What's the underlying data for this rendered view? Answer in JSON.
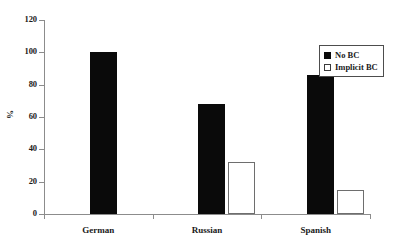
{
  "chart_data": {
    "type": "bar",
    "title": "",
    "xlabel": "",
    "ylabel": "%",
    "ylim": [
      0,
      120
    ],
    "yticks": [
      0,
      20,
      40,
      60,
      80,
      100,
      120
    ],
    "ytick_labels": [
      "0",
      "20",
      "40",
      "60",
      "80",
      "100",
      "120"
    ],
    "grid": false,
    "legend_position": "top-right",
    "categories": [
      "German",
      "Russian",
      "Spanish"
    ],
    "series": [
      {
        "name": "No BC",
        "style": "filled-black",
        "color": "#0a0a0a",
        "values": [
          100,
          68,
          86
        ]
      },
      {
        "name": "Implicit BC",
        "style": "hollow-white",
        "color": "#ffffff",
        "values": [
          0,
          32,
          15
        ]
      }
    ]
  },
  "axis": {
    "y_title": "%",
    "tick_labels": [
      "120",
      "100",
      "80",
      "60",
      "40",
      "20",
      "0"
    ]
  },
  "legend": {
    "entries": [
      {
        "label": "No BC",
        "swatch": "filled-square"
      },
      {
        "label": "Implicit BC",
        "swatch": "hollow-square"
      }
    ]
  }
}
